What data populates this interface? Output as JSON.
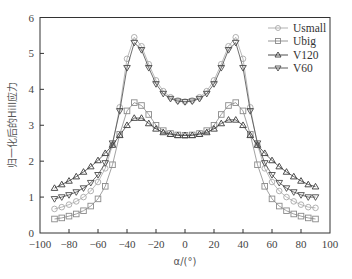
{
  "chart_data": {
    "type": "line",
    "title": "",
    "xlabel": "α/(°)",
    "ylabel": "归一化后的Hill应力",
    "xlim": [
      -100,
      100
    ],
    "ylim": [
      0,
      6
    ],
    "xticks": [
      -100,
      -80,
      -60,
      -40,
      -20,
      0,
      20,
      40,
      60,
      80,
      100
    ],
    "yticks": [
      0,
      1,
      2,
      3,
      4,
      5,
      6
    ],
    "grid": false,
    "legend_position": "upper right",
    "x": [
      -90,
      -85,
      -80,
      -75,
      -70,
      -65,
      -60,
      -55,
      -50,
      -45,
      -40,
      -35,
      -30,
      -25,
      -20,
      -15,
      -10,
      -5,
      0,
      5,
      10,
      15,
      20,
      25,
      30,
      35,
      40,
      45,
      50,
      55,
      60,
      65,
      70,
      75,
      80,
      85,
      90
    ],
    "series": [
      {
        "name": "Usmall",
        "marker": "circle",
        "color": "#a8a8a8",
        "values": [
          0.67,
          0.72,
          0.79,
          0.88,
          1.0,
          1.17,
          1.42,
          1.8,
          2.45,
          3.5,
          4.85,
          5.45,
          5.2,
          4.7,
          4.25,
          3.95,
          3.78,
          3.69,
          3.66,
          3.69,
          3.78,
          3.95,
          4.25,
          4.7,
          5.2,
          5.45,
          4.85,
          3.5,
          2.45,
          1.8,
          1.42,
          1.17,
          1.0,
          0.88,
          0.79,
          0.72,
          0.7
        ]
      },
      {
        "name": "Ubig",
        "marker": "square",
        "color": "#8a8a8a",
        "values": [
          0.39,
          0.42,
          0.47,
          0.53,
          0.62,
          0.75,
          0.95,
          1.3,
          1.9,
          2.75,
          3.4,
          3.63,
          3.55,
          3.3,
          3.0,
          2.85,
          2.77,
          2.73,
          2.72,
          2.73,
          2.77,
          2.85,
          3.0,
          3.3,
          3.55,
          3.63,
          3.4,
          2.75,
          1.9,
          1.3,
          0.95,
          0.75,
          0.62,
          0.53,
          0.47,
          0.42,
          0.39
        ]
      },
      {
        "name": "V120",
        "marker": "triangle-up",
        "color": "#3a3a3a",
        "values": [
          1.25,
          1.35,
          1.45,
          1.57,
          1.7,
          1.85,
          2.02,
          2.22,
          2.45,
          2.72,
          3.0,
          3.2,
          3.2,
          3.05,
          2.9,
          2.8,
          2.75,
          2.72,
          2.72,
          2.72,
          2.75,
          2.8,
          2.9,
          3.05,
          3.15,
          3.15,
          3.0,
          2.72,
          2.45,
          2.22,
          2.02,
          1.85,
          1.7,
          1.57,
          1.45,
          1.35,
          1.29
        ]
      },
      {
        "name": "V60",
        "marker": "triangle-down",
        "color": "#4a4a4a",
        "values": [
          0.95,
          1.0,
          1.06,
          1.14,
          1.25,
          1.4,
          1.62,
          1.95,
          2.5,
          3.4,
          4.6,
          5.3,
          5.1,
          4.6,
          4.15,
          3.88,
          3.74,
          3.67,
          3.65,
          3.67,
          3.74,
          3.88,
          4.15,
          4.6,
          5.1,
          5.3,
          4.6,
          3.4,
          2.5,
          1.95,
          1.62,
          1.4,
          1.25,
          1.14,
          1.06,
          1.0,
          1.0
        ]
      }
    ]
  },
  "legend": {
    "items": [
      {
        "label": "Usmall"
      },
      {
        "label": "Ubig"
      },
      {
        "label": "V120"
      },
      {
        "label": "V60"
      }
    ]
  },
  "axes": {
    "xlabel": "α/(°)",
    "ylabel": "归一化后的Hill应力"
  }
}
